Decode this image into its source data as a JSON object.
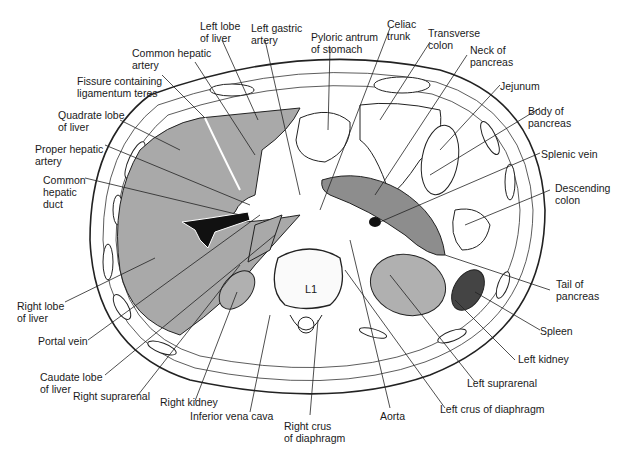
{
  "figure": {
    "vertebra_label": "L1",
    "colors": {
      "liver": "#a9a9a9",
      "organ": "#b0b0b0",
      "duct": "#111111",
      "line": "#222222",
      "bg": "#ffffff"
    }
  },
  "labels": {
    "left_lobe_liver": "Left lobe\nof liver",
    "left_gastric_artery": "Left gastric\nartery",
    "pyloric_antrum": "Pyloric antrum\nof stomach",
    "celiac_trunk": "Celiac\ntrunk",
    "transverse_colon": "Transverse\ncolon",
    "neck_pancreas": "Neck of\npancreas",
    "common_hepatic_artery": "Common hepatic\nartery",
    "fissure_ligamentum_teres": "Fissure containing\nligamentum teres",
    "quadrate_lobe": "Quadrate lobe\nof liver",
    "proper_hepatic_artery": "Proper hepatic\nartery",
    "common_hepatic_duct": "Common\nhepatic\nduct",
    "jejunum": "Jejunum",
    "body_pancreas": "Body of\npancreas",
    "splenic_vein": "Splenic vein",
    "descending_colon": "Descending\ncolon",
    "right_lobe_liver": "Right lobe\nof liver",
    "portal_vein": "Portal vein",
    "caudate_lobe": "Caudate lobe\nof liver",
    "right_suprarenal": "Right suprarenal",
    "right_kidney": "Right kidney",
    "inferior_vena_cava": "Inferior vena cava",
    "right_crus": "Right crus\nof diaphragm",
    "aorta": "Aorta",
    "left_crus": "Left crus of diaphragm",
    "left_suprarenal": "Left suprarenal",
    "left_kidney": "Left kidney",
    "spleen": "Spleen",
    "tail_pancreas": "Tail of\npancreas"
  }
}
